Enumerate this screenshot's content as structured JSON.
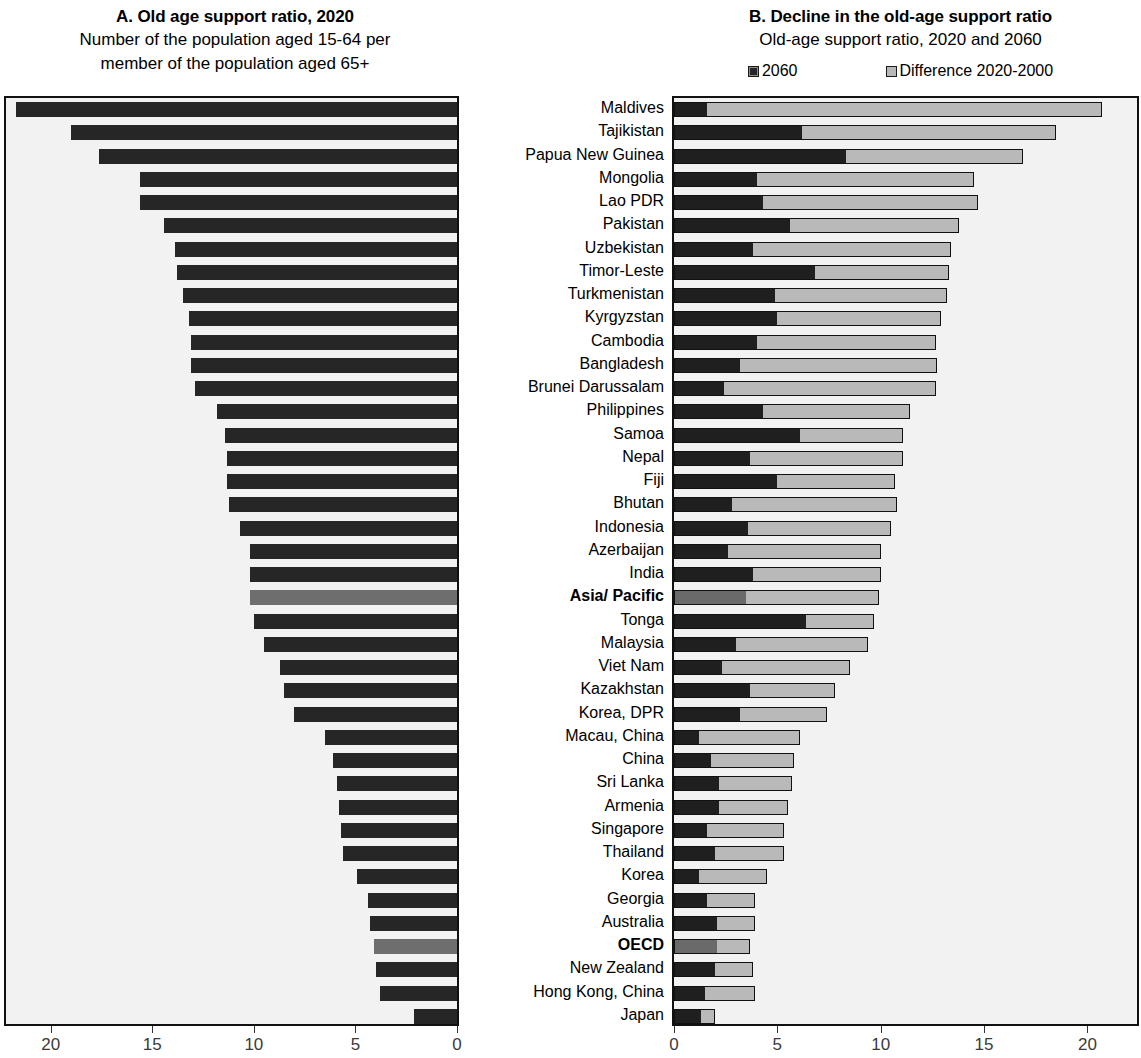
{
  "panelA": {
    "title": "A. Old age support ratio, 2020",
    "subtitle_line1": "Number of the population aged 15-64 per",
    "subtitle_line2": "member of the population aged 65+"
  },
  "panelB": {
    "title": "B. Decline in the old-age support ratio",
    "subtitle": "Old-age support ratio, 2020 and 2060",
    "legend": [
      {
        "label": "2060",
        "swatch": "dark",
        "color": "#262626"
      },
      {
        "label": "Difference 2020-2000",
        "swatch": "light",
        "color": "#b9b9b9"
      }
    ]
  },
  "colors": {
    "bar_dark": "#262626",
    "bar_light": "#b9b9b9",
    "bar_aggregate": "#6e6e6e",
    "plot_background": "#f2f2f2",
    "frame": "#111111"
  },
  "chart_data": [
    {
      "type": "bar",
      "panel": "A",
      "title": "A. Old age support ratio, 2020",
      "subtitle": "Number of the population aged 15-64 per member of the population aged 65+",
      "orientation": "horizontal",
      "direction": "right-to-left",
      "xlabel": "",
      "ylabel": "",
      "xlim": [
        20,
        0
      ],
      "xticks": [
        20,
        15,
        10,
        5,
        0
      ],
      "grid": false,
      "legend": "none",
      "categories": [
        "Maldives",
        "Tajikistan",
        "Papua New Guinea",
        "Mongolia",
        "Lao PDR",
        "Pakistan",
        "Uzbekistan",
        "Timor-Leste",
        "Turkmenistan",
        "Kyrgyzstan",
        "Cambodia",
        "Bangladesh",
        "Brunei Darussalam",
        "Philippines",
        "Samoa",
        "Nepal",
        "Fiji",
        "Bhutan",
        "Indonesia",
        "Azerbaijan",
        "India",
        "Asia/ Pacific",
        "Tonga",
        "Malaysia",
        "Viet Nam",
        "Kazakhstan",
        "Korea, DPR",
        "Macau, China",
        "China",
        "Sri Lanka",
        "Armenia",
        "Singapore",
        "Thailand",
        "Korea",
        "Georgia",
        "Australia",
        "OECD",
        "New Zealand",
        "Hong Kong, China",
        "Japan"
      ],
      "values": [
        21.7,
        19.0,
        17.6,
        15.6,
        15.6,
        14.4,
        13.9,
        13.8,
        13.5,
        13.2,
        13.1,
        13.1,
        12.9,
        11.8,
        11.4,
        11.3,
        11.3,
        11.2,
        10.7,
        10.2,
        10.2,
        10.2,
        10.0,
        9.5,
        8.7,
        8.5,
        8.0,
        6.5,
        6.1,
        5.9,
        5.8,
        5.7,
        5.6,
        4.9,
        4.4,
        4.3,
        4.1,
        4.0,
        3.8,
        2.1
      ],
      "aggregate_rows": [
        "Asia/ Pacific",
        "OECD"
      ]
    },
    {
      "type": "bar",
      "panel": "B",
      "subtype": "stacked",
      "title": "B. Decline in the old-age support ratio",
      "subtitle": "Old-age support ratio, 2020 and 2060",
      "orientation": "horizontal",
      "direction": "left-to-right",
      "xlabel": "",
      "ylabel": "",
      "xlim": [
        0,
        22
      ],
      "xticks": [
        0,
        5,
        10,
        15,
        20
      ],
      "grid": false,
      "legend_position": "top",
      "categories": [
        "Maldives",
        "Tajikistan",
        "Papua New Guinea",
        "Mongolia",
        "Lao PDR",
        "Pakistan",
        "Uzbekistan",
        "Timor-Leste",
        "Turkmenistan",
        "Kyrgyzstan",
        "Cambodia",
        "Bangladesh",
        "Brunei Darussalam",
        "Philippines",
        "Samoa",
        "Nepal",
        "Fiji",
        "Bhutan",
        "Indonesia",
        "Azerbaijan",
        "India",
        "Asia/ Pacific",
        "Tonga",
        "Malaysia",
        "Viet Nam",
        "Kazakhstan",
        "Korea, DPR",
        "Macau, China",
        "China",
        "Sri Lanka",
        "Armenia",
        "Singapore",
        "Thailand",
        "Korea",
        "Georgia",
        "Australia",
        "OECD",
        "New Zealand",
        "Hong Kong, China",
        "Japan"
      ],
      "series": [
        {
          "name": "2060",
          "values": [
            1.6,
            6.2,
            8.3,
            4.0,
            4.3,
            5.6,
            3.8,
            6.8,
            4.9,
            5.0,
            4.0,
            3.2,
            2.4,
            4.3,
            6.1,
            3.7,
            5.0,
            2.8,
            3.6,
            2.6,
            3.8,
            3.5,
            6.4,
            3.0,
            2.3,
            3.7,
            3.2,
            1.2,
            1.8,
            2.2,
            2.2,
            1.6,
            2.0,
            1.2,
            1.6,
            2.1,
            2.1,
            2.0,
            1.5,
            1.3
          ]
        },
        {
          "name": "Difference 2020-2000",
          "values": [
            19.1,
            12.3,
            8.6,
            10.5,
            10.4,
            8.2,
            9.6,
            6.5,
            8.3,
            7.9,
            8.7,
            9.5,
            10.3,
            7.1,
            5.0,
            7.4,
            5.7,
            8.0,
            6.9,
            7.4,
            6.2,
            6.4,
            3.3,
            6.4,
            6.2,
            4.1,
            4.2,
            4.9,
            4.0,
            3.5,
            3.3,
            3.7,
            3.3,
            3.3,
            2.3,
            1.8,
            1.6,
            1.8,
            2.4,
            0.7
          ]
        }
      ],
      "aggregate_rows": [
        "Asia/ Pacific",
        "OECD"
      ]
    }
  ],
  "countries": [
    {
      "name": "Maldives",
      "bold": false
    },
    {
      "name": "Tajikistan",
      "bold": false
    },
    {
      "name": "Papua New Guinea",
      "bold": false
    },
    {
      "name": "Mongolia",
      "bold": false
    },
    {
      "name": "Lao PDR",
      "bold": false
    },
    {
      "name": "Pakistan",
      "bold": false
    },
    {
      "name": "Uzbekistan",
      "bold": false
    },
    {
      "name": "Timor-Leste",
      "bold": false
    },
    {
      "name": "Turkmenistan",
      "bold": false
    },
    {
      "name": "Kyrgyzstan",
      "bold": false
    },
    {
      "name": "Cambodia",
      "bold": false
    },
    {
      "name": "Bangladesh",
      "bold": false
    },
    {
      "name": "Brunei Darussalam",
      "bold": false
    },
    {
      "name": "Philippines",
      "bold": false
    },
    {
      "name": "Samoa",
      "bold": false
    },
    {
      "name": "Nepal",
      "bold": false
    },
    {
      "name": "Fiji",
      "bold": false
    },
    {
      "name": "Bhutan",
      "bold": false
    },
    {
      "name": "Indonesia",
      "bold": false
    },
    {
      "name": "Azerbaijan",
      "bold": false
    },
    {
      "name": "India",
      "bold": false
    },
    {
      "name": "Asia/ Pacific",
      "bold": true
    },
    {
      "name": "Tonga",
      "bold": false
    },
    {
      "name": "Malaysia",
      "bold": false
    },
    {
      "name": "Viet Nam",
      "bold": false
    },
    {
      "name": "Kazakhstan",
      "bold": false
    },
    {
      "name": "Korea, DPR",
      "bold": false
    },
    {
      "name": "Macau, China",
      "bold": false
    },
    {
      "name": "China",
      "bold": false
    },
    {
      "name": "Sri Lanka",
      "bold": false
    },
    {
      "name": "Armenia",
      "bold": false
    },
    {
      "name": "Singapore",
      "bold": false
    },
    {
      "name": "Thailand",
      "bold": false
    },
    {
      "name": "Korea",
      "bold": false
    },
    {
      "name": "Georgia",
      "bold": false
    },
    {
      "name": "Australia",
      "bold": false
    },
    {
      "name": "OECD",
      "bold": true
    },
    {
      "name": "New Zealand",
      "bold": false
    },
    {
      "name": "Hong Kong, China",
      "bold": false
    },
    {
      "name": "Japan",
      "bold": false
    }
  ],
  "axisA": {
    "ticks": [
      "20",
      "15",
      "10",
      "5",
      "0"
    ]
  },
  "axisB": {
    "ticks": [
      "0",
      "5",
      "10",
      "15",
      "20"
    ]
  }
}
